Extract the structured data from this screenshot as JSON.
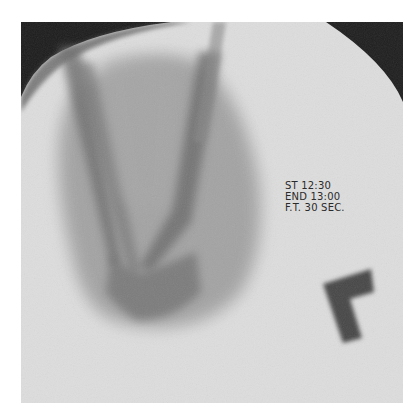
{
  "image": {
    "description": "Fluoroscopic X-ray image of a lower limb (knee region) with timing annotation and L-shaped marker",
    "colors": {
      "background": "#ffffff",
      "field": "#dedede",
      "collimator": "#1e1e1e",
      "marker": "#4a4a4a"
    }
  },
  "annotation": {
    "lines": [
      "ST 12:30",
      "END 13:00",
      "F.T. 30 SEC."
    ]
  },
  "marker": {
    "shape": "L",
    "label": "orientation marker"
  }
}
